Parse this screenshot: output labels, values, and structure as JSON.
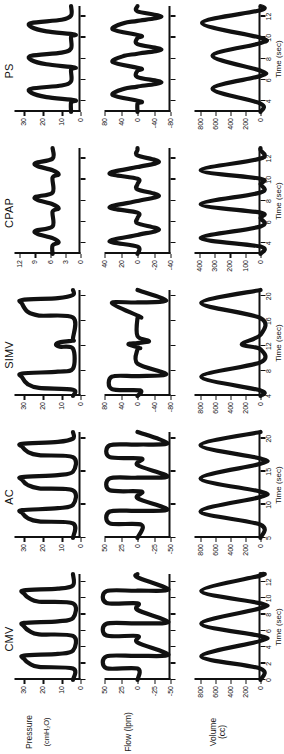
{
  "figure": {
    "rows": [
      {
        "id": "pressure",
        "label_line1": "Pressure",
        "label_line2": "(cmH₂O)"
      },
      {
        "id": "flow",
        "label_line1": "Flow (lpm)",
        "label_line2": ""
      },
      {
        "id": "volume",
        "label_line1": "Volume (cc)",
        "label_line2": ""
      }
    ],
    "columns": [
      {
        "id": "cmv",
        "title": "CMV"
      },
      {
        "id": "ac",
        "title": "AC"
      },
      {
        "id": "simv",
        "title": "SIMV"
      },
      {
        "id": "cpap",
        "title": "CPAP"
      },
      {
        "id": "ps",
        "title": "PS"
      }
    ],
    "xaxis_title": "Time (sec)"
  },
  "chart_data": [
    {
      "type": "line",
      "title": "CMV",
      "panel": "pressure",
      "ylabel": "Pressure (cmH2O)",
      "xlabel": "Time (sec)",
      "ylim": [
        0,
        35
      ],
      "yticks": [
        0,
        10,
        20,
        30
      ],
      "ytick_labels": [
        "0",
        "10",
        "20",
        "30"
      ],
      "xlim": [
        0,
        13
      ],
      "xticks": [
        0,
        2,
        4,
        6,
        8,
        10,
        12
      ],
      "xtick_labels": [
        "0",
        "2",
        "4",
        "6",
        "8",
        "10",
        "12"
      ],
      "grid": false,
      "legend": "none",
      "x": [
        0,
        1.4,
        1.6,
        2.0,
        2.6,
        3.0,
        3.2,
        3.6,
        5.4,
        5.6,
        6.0,
        6.6,
        7.0,
        7.2,
        7.6,
        9.4,
        9.6,
        10.0,
        10.6,
        11.0,
        11.2,
        11.6,
        13
      ],
      "y": [
        4,
        4,
        22,
        27,
        30,
        30,
        12,
        4,
        4,
        22,
        27,
        30,
        30,
        12,
        4,
        4,
        22,
        27,
        30,
        30,
        12,
        4,
        4
      ]
    },
    {
      "type": "line",
      "title": "CMV",
      "panel": "flow",
      "ylabel": "Flow (lpm)",
      "xlabel": "Time (sec)",
      "ylim": [
        -50,
        50
      ],
      "yticks": [
        -50,
        -25,
        0,
        25,
        50
      ],
      "ytick_labels": [
        "-50",
        "-25",
        "0",
        "25",
        "50"
      ],
      "xlim": [
        0,
        13
      ],
      "xticks": [
        0,
        2,
        4,
        6,
        8,
        10,
        12
      ],
      "xtick_labels": [
        "0",
        "2",
        "4",
        "6",
        "8",
        "10",
        "12"
      ],
      "grid": false,
      "legend": "none",
      "x": [
        0,
        1.4,
        1.45,
        2.9,
        2.95,
        3.1,
        4.6,
        5.4,
        5.45,
        6.9,
        6.95,
        7.1,
        8.6,
        9.4,
        9.45,
        10.9,
        10.95,
        11.1,
        12.6,
        13
      ],
      "y": [
        0,
        0,
        47,
        47,
        0,
        -47,
        0,
        0,
        47,
        47,
        0,
        -47,
        0,
        0,
        47,
        47,
        0,
        -47,
        0,
        0
      ]
    },
    {
      "type": "line",
      "title": "CMV",
      "panel": "volume",
      "ylabel": "Volume (cc)",
      "xlabel": "Time (sec)",
      "ylim": [
        0,
        880
      ],
      "yticks": [
        0,
        200,
        400,
        600,
        800
      ],
      "ytick_labels": [
        "0",
        "200",
        "400",
        "600",
        "800"
      ],
      "xlim": [
        0,
        13
      ],
      "xticks": [
        0,
        2,
        4,
        6,
        8,
        10,
        12
      ],
      "xtick_labels": [
        "0",
        "2",
        "4",
        "6",
        "8",
        "10",
        "12"
      ],
      "grid": false,
      "legend": "none",
      "x": [
        0,
        1.4,
        2.9,
        4.8,
        5.4,
        6.9,
        8.8,
        9.4,
        10.9,
        12.8,
        13
      ],
      "y": [
        0,
        0,
        790,
        0,
        0,
        790,
        0,
        0,
        790,
        0,
        0
      ]
    },
    {
      "type": "line",
      "title": "AC",
      "panel": "pressure",
      "ylabel": "Pressure (cmH2O)",
      "xlabel": "Time (sec)",
      "ylim": [
        0,
        35
      ],
      "yticks": [
        0,
        10,
        20,
        30
      ],
      "ytick_labels": [
        "0",
        "10",
        "20",
        "30"
      ],
      "xlim": [
        5,
        21
      ],
      "xticks": [
        5,
        10,
        15,
        20
      ],
      "xtick_labels": [
        "5",
        "10",
        "15",
        "20"
      ],
      "grid": false,
      "legend": "none",
      "x": [
        5,
        7.2,
        7.5,
        8.0,
        8.8,
        9.2,
        9.5,
        10.0,
        12.2,
        12.5,
        13.0,
        13.8,
        14.2,
        14.5,
        15.0,
        17.2,
        17.5,
        18.0,
        18.8,
        19.2,
        19.5,
        20.0,
        21
      ],
      "y": [
        4,
        4,
        22,
        28,
        31,
        31,
        12,
        4,
        4,
        22,
        28,
        31,
        31,
        12,
        4,
        4,
        22,
        28,
        31,
        31,
        12,
        4,
        4
      ]
    },
    {
      "type": "line",
      "title": "AC",
      "panel": "flow",
      "ylabel": "Flow (lpm)",
      "xlabel": "Time (sec)",
      "ylim": [
        -50,
        50
      ],
      "yticks": [
        -50,
        -25,
        0,
        25,
        50
      ],
      "ytick_labels": [
        "-50",
        "-25",
        "0",
        "25",
        "50"
      ],
      "xlim": [
        5,
        21
      ],
      "xticks": [
        5,
        10,
        15,
        20
      ],
      "xtick_labels": [
        "5",
        "10",
        "15",
        "20"
      ],
      "grid": false,
      "legend": "none",
      "x": [
        5,
        7.0,
        7.2,
        9.0,
        9.1,
        9.3,
        11.0,
        12.0,
        12.2,
        14.0,
        14.1,
        14.3,
        16.0,
        17.0,
        17.2,
        19.0,
        19.1,
        19.3,
        21
      ],
      "y": [
        0,
        -6,
        42,
        42,
        0,
        -46,
        0,
        -6,
        42,
        42,
        0,
        -46,
        0,
        -6,
        42,
        42,
        0,
        -46,
        0
      ]
    },
    {
      "type": "line",
      "title": "AC",
      "panel": "volume",
      "ylabel": "Volume (cc)",
      "xlabel": "Time (sec)",
      "ylim": [
        0,
        880
      ],
      "yticks": [
        0,
        200,
        400,
        600,
        800
      ],
      "ytick_labels": [
        "0",
        "200",
        "400",
        "600",
        "800"
      ],
      "xlim": [
        5,
        21
      ],
      "xticks": [
        5,
        10,
        15,
        20
      ],
      "xtick_labels": [
        "5",
        "10",
        "15",
        "20"
      ],
      "grid": false,
      "legend": "none",
      "x": [
        5,
        7.0,
        9.0,
        11.2,
        12.0,
        14.0,
        16.2,
        17.0,
        19.0,
        21
      ],
      "y": [
        0,
        0,
        800,
        0,
        0,
        800,
        0,
        0,
        800,
        0
      ]
    },
    {
      "type": "line",
      "title": "SIMV",
      "panel": "pressure",
      "ylabel": "Pressure (cmH2O)",
      "xlabel": "Time (sec)",
      "ylim": [
        0,
        35
      ],
      "yticks": [
        0,
        10,
        20,
        30
      ],
      "ytick_labels": [
        "0",
        "10",
        "20",
        "30"
      ],
      "xlim": [
        4,
        21
      ],
      "xticks": [
        4,
        8,
        12,
        16,
        20
      ],
      "xtick_labels": [
        "4",
        "8",
        "12",
        "16",
        "20"
      ],
      "grid": false,
      "legend": "none",
      "x": [
        4,
        5.0,
        5.3,
        5.9,
        7.0,
        7.6,
        7.9,
        8.4,
        11.6,
        11.9,
        12.2,
        12.6,
        12.9,
        13.2,
        16.6,
        16.9,
        17.5,
        18.8,
        19.4,
        19.7,
        20.2,
        21
      ],
      "y": [
        4,
        4,
        22,
        28,
        31,
        31,
        12,
        4,
        4,
        11,
        13,
        11,
        4,
        4,
        4,
        22,
        28,
        31,
        31,
        12,
        4,
        4
      ]
    },
    {
      "type": "line",
      "title": "SIMV",
      "panel": "flow",
      "ylabel": "Flow (lpm)",
      "xlabel": "Time (sec)",
      "ylim": [
        -80,
        80
      ],
      "yticks": [
        -80,
        -40,
        0,
        40,
        80
      ],
      "ytick_labels": [
        "-80",
        "-40",
        "0",
        "40",
        "80"
      ],
      "xlim": [
        4,
        21
      ],
      "xticks": [
        4,
        8,
        12,
        16,
        20
      ],
      "xtick_labels": [
        "4",
        "8",
        "12",
        "16",
        "20"
      ],
      "grid": false,
      "legend": "none",
      "x": [
        4,
        4.9,
        5.1,
        7.1,
        7.2,
        7.5,
        9.2,
        11.5,
        11.7,
        12.3,
        12.5,
        12.8,
        13.6,
        16.5,
        16.7,
        18.9,
        19.0,
        19.3,
        21
      ],
      "y": [
        0,
        -6,
        62,
        62,
        0,
        -70,
        0,
        0,
        -6,
        22,
        0,
        -28,
        0,
        0,
        -6,
        62,
        0,
        -70,
        0
      ]
    },
    {
      "type": "line",
      "title": "SIMV",
      "panel": "volume",
      "ylabel": "Volume (cc)",
      "xlabel": "Time (sec)",
      "ylim": [
        0,
        880
      ],
      "yticks": [
        0,
        200,
        400,
        600,
        800
      ],
      "ytick_labels": [
        "0",
        "200",
        "400",
        "600",
        "800"
      ],
      "xlim": [
        4,
        21
      ],
      "xticks": [
        4,
        8,
        12,
        16,
        20
      ],
      "xtick_labels": [
        "4",
        "8",
        "12",
        "16",
        "20"
      ],
      "grid": false,
      "legend": "none",
      "x": [
        4,
        4.9,
        7.1,
        9.4,
        11.5,
        12.3,
        13.8,
        16.5,
        18.9,
        21
      ],
      "y": [
        0,
        0,
        790,
        0,
        0,
        250,
        0,
        0,
        790,
        0
      ]
    },
    {
      "type": "line",
      "title": "CPAP",
      "panel": "pressure",
      "ylabel": "Pressure (cmH2O)",
      "xlabel": "Time (sec)",
      "ylim": [
        0,
        13
      ],
      "yticks": [
        0,
        3,
        6,
        9,
        12
      ],
      "ytick_labels": [
        "0",
        "3",
        "6",
        "9",
        "12"
      ],
      "xlim": [
        3,
        13
      ],
      "xticks": [
        4,
        6,
        8,
        10,
        12
      ],
      "xtick_labels": [
        "4",
        "6",
        "8",
        "10",
        "12"
      ],
      "grid": false,
      "legend": "none",
      "x": [
        3,
        3.8,
        4.1,
        4.5,
        4.9,
        5.2,
        5.6,
        7.0,
        7.3,
        7.7,
        8.1,
        8.4,
        8.8,
        10.2,
        10.5,
        10.9,
        11.3,
        11.6,
        12.0,
        13
      ],
      "y": [
        5.5,
        5.5,
        4.3,
        5.5,
        8.5,
        8.8,
        5.5,
        5.5,
        4.3,
        5.5,
        8.5,
        8.8,
        5.5,
        5.5,
        4.3,
        5.5,
        8.5,
        8.8,
        5.5,
        5.5
      ]
    },
    {
      "type": "line",
      "title": "CPAP",
      "panel": "flow",
      "ylabel": "Flow (lpm)",
      "xlabel": "Time (sec)",
      "ylim": [
        -40,
        40
      ],
      "yticks": [
        -40,
        -20,
        0,
        20,
        40
      ],
      "ytick_labels": [
        "-40",
        "-20",
        "0",
        "20",
        "40"
      ],
      "xlim": [
        3,
        13
      ],
      "xticks": [
        4,
        6,
        8,
        10,
        12
      ],
      "xtick_labels": [
        "4",
        "6",
        "8",
        "10",
        "12"
      ],
      "grid": false,
      "legend": "none",
      "x": [
        3,
        3.7,
        4.2,
        4.8,
        5.3,
        5.9,
        6.4,
        6.9,
        7.4,
        8.0,
        8.5,
        9.1,
        9.6,
        10.1,
        10.6,
        11.2,
        11.7,
        12.3,
        12.8,
        13
      ],
      "y": [
        0,
        0,
        34,
        0,
        -26,
        0,
        0,
        0,
        34,
        0,
        -26,
        0,
        0,
        0,
        34,
        0,
        -26,
        0,
        0,
        0
      ]
    },
    {
      "type": "line",
      "title": "CPAP",
      "panel": "volume",
      "ylabel": "Volume (cc)",
      "xlabel": "Time (sec)",
      "ylim": [
        0,
        430
      ],
      "yticks": [
        0,
        100,
        200,
        300,
        400
      ],
      "ytick_labels": [
        "0",
        "100",
        "200",
        "300",
        "400"
      ],
      "xlim": [
        3,
        13
      ],
      "xticks": [
        4,
        6,
        8,
        10,
        12
      ],
      "xtick_labels": [
        "4",
        "6",
        "8",
        "10",
        "12"
      ],
      "grid": false,
      "legend": "none",
      "x": [
        3,
        3.7,
        4.5,
        5.6,
        6.4,
        6.9,
        7.7,
        8.8,
        9.6,
        10.1,
        10.9,
        12.0,
        12.8,
        13
      ],
      "y": [
        0,
        0,
        390,
        0,
        0,
        0,
        390,
        0,
        0,
        0,
        390,
        0,
        0,
        0
      ]
    },
    {
      "type": "line",
      "title": "PS",
      "panel": "pressure",
      "ylabel": "Pressure (cmH2O)",
      "xlabel": "Time (sec)",
      "ylim": [
        0,
        35
      ],
      "yticks": [
        0,
        10,
        20,
        30
      ],
      "ytick_labels": [
        "0",
        "10",
        "20",
        "30"
      ],
      "xlim": [
        3,
        13
      ],
      "xticks": [
        4,
        6,
        8,
        10,
        12
      ],
      "xtick_labels": [
        "4",
        "6",
        "8",
        "10",
        "12"
      ],
      "grid": false,
      "legend": "none",
      "x": [
        3,
        3.9,
        4.1,
        4.4,
        4.8,
        5.2,
        5.5,
        5.9,
        7.0,
        7.2,
        7.5,
        7.9,
        8.3,
        8.6,
        9.0,
        10.1,
        10.3,
        10.6,
        11.0,
        11.4,
        11.7,
        12.1,
        13
      ],
      "y": [
        5,
        5,
        3,
        18,
        26,
        26,
        10,
        5,
        5,
        3,
        18,
        26,
        26,
        10,
        5,
        5,
        3,
        18,
        26,
        26,
        10,
        5,
        5
      ]
    },
    {
      "type": "line",
      "title": "PS",
      "panel": "flow",
      "ylabel": "Flow (lpm)",
      "xlabel": "Time (sec)",
      "ylim": [
        -80,
        80
      ],
      "yticks": [
        -80,
        -40,
        0,
        40,
        80
      ],
      "ytick_labels": [
        "-80",
        "-40",
        "0",
        "40",
        "80"
      ],
      "xlim": [
        3,
        13
      ],
      "xticks": [
        4,
        6,
        8,
        10,
        12
      ],
      "xtick_labels": [
        "4",
        "6",
        "8",
        "10",
        "12"
      ],
      "grid": false,
      "legend": "none",
      "x": [
        3,
        3.8,
        4.0,
        4.6,
        5.2,
        5.4,
        5.8,
        6.3,
        6.9,
        7.1,
        7.7,
        8.3,
        8.5,
        8.9,
        9.4,
        10.0,
        10.2,
        10.8,
        11.4,
        11.6,
        12.0,
        12.5,
        13
      ],
      "y": [
        0,
        0,
        -8,
        60,
        32,
        0,
        -58,
        0,
        0,
        -8,
        60,
        32,
        0,
        -58,
        0,
        0,
        -8,
        60,
        32,
        0,
        -58,
        0,
        0
      ]
    },
    {
      "type": "line",
      "title": "PS",
      "panel": "volume",
      "ylabel": "Volume (cc)",
      "xlabel": "Time (sec)",
      "ylim": [
        0,
        880
      ],
      "yticks": [
        0,
        200,
        400,
        600,
        800
      ],
      "ytick_labels": [
        "0",
        "200",
        "400",
        "600",
        "800"
      ],
      "xlim": [
        3,
        13
      ],
      "xticks": [
        4,
        6,
        8,
        10,
        12
      ],
      "xtick_labels": [
        "4",
        "6",
        "8",
        "10",
        "12"
      ],
      "grid": false,
      "legend": "none",
      "x": [
        3,
        3.8,
        5.2,
        6.4,
        6.9,
        8.3,
        9.5,
        10.0,
        11.4,
        12.6,
        13
      ],
      "y": [
        0,
        0,
        640,
        0,
        0,
        640,
        0,
        0,
        780,
        0,
        0
      ]
    }
  ]
}
